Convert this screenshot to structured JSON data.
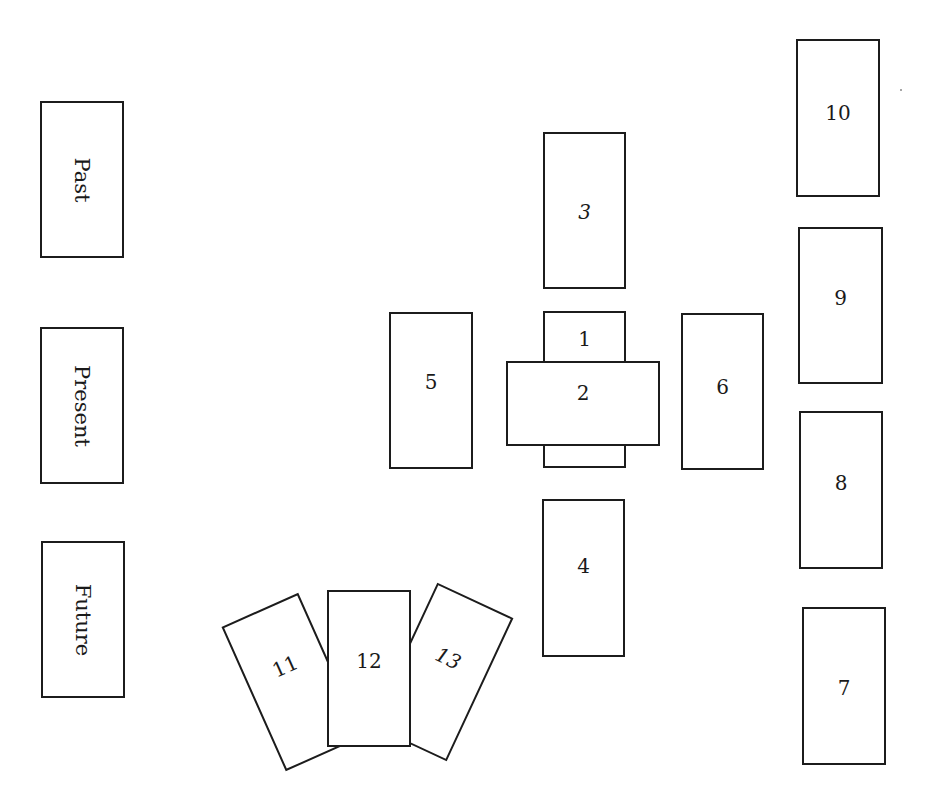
{
  "diagram": {
    "type": "tarot-spread-layout",
    "time_labels": [
      {
        "label": "Past"
      },
      {
        "label": "Present"
      },
      {
        "label": "Future"
      }
    ],
    "cards": [
      {
        "position": 1,
        "label": "1"
      },
      {
        "position": 2,
        "label": "2",
        "orientation": "horizontal, crossing card 1"
      },
      {
        "position": 3,
        "label": "3"
      },
      {
        "position": 4,
        "label": "4"
      },
      {
        "position": 5,
        "label": "5"
      },
      {
        "position": 6,
        "label": "6"
      },
      {
        "position": 7,
        "label": "7"
      },
      {
        "position": 8,
        "label": "8"
      },
      {
        "position": 9,
        "label": "9"
      },
      {
        "position": 10,
        "label": "10"
      },
      {
        "position": 11,
        "label": "11",
        "orientation": "tilted left"
      },
      {
        "position": 12,
        "label": "12"
      },
      {
        "position": 13,
        "label": "13",
        "orientation": "tilted right"
      }
    ]
  },
  "colors": {
    "stroke": "#1c1c1c",
    "fill": "#ffffff",
    "background": "#ffffff"
  }
}
